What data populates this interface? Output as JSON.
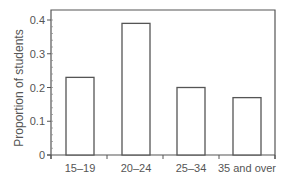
{
  "chart_data": {
    "type": "bar",
    "title": "",
    "xlabel": "",
    "ylabel": "Proportion of students",
    "categories": [
      "15–19",
      "20–24",
      "25–34",
      "35 and over"
    ],
    "values": [
      0.23,
      0.39,
      0.2,
      0.17
    ],
    "ylim": [
      0,
      0.43
    ],
    "yticks": [
      0,
      0.1,
      0.2,
      0.3,
      0.4
    ],
    "ytick_labels": [
      "0",
      "0.1",
      "0.2",
      "0.3",
      "0.4"
    ],
    "minor_yticks_per_major": 5,
    "grid": false,
    "legend": null,
    "colors": {
      "bar_fill": "#ffffff",
      "bar_stroke": "#555555",
      "axis": "#555555",
      "text": "#555555"
    }
  }
}
